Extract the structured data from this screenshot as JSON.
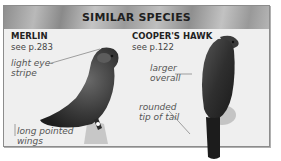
{
  "header": {
    "title": "SIMILAR SPECIES"
  },
  "species": [
    {
      "name": "MERLIN",
      "page_ref": "see p.283",
      "annotations": [
        "light eye-stripe",
        "long pointed wings"
      ],
      "annotation_lines": [
        [
          "light eye-",
          "stripe"
        ],
        [
          "long pointed",
          "wings"
        ]
      ]
    },
    {
      "name": "COOPER'S HAWK",
      "page_ref": "see p.122",
      "annotations": [
        "larger overall",
        "rounded tip of tail"
      ],
      "annotation_lines": [
        [
          "larger",
          "overall"
        ],
        [
          "rounded",
          "tip of tail"
        ]
      ]
    }
  ],
  "colors": {
    "panel_bg": "#efefef",
    "panel_border": "#8c8c8c",
    "header_bg": "#a8a8a8",
    "title_text": "#1f1f1f",
    "annotation_text": "#555555"
  }
}
